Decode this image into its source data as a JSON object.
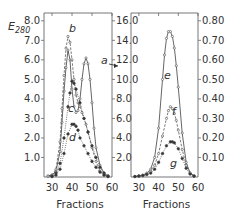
{
  "chart_data": [
    {
      "type": "line",
      "panel": "left",
      "ylabel": "E280",
      "xlabel": "Fractions",
      "xlim": [
        26,
        60
      ],
      "x_ticks": [
        30,
        40,
        50,
        60
      ],
      "ylim_left": [
        0,
        8.4
      ],
      "y_ticks_left": [
        "1.0",
        "2.0",
        "3.0",
        "4.0",
        "5.0",
        "6.0",
        "7.0",
        "8.0"
      ],
      "ylim_right": [
        0,
        16.8
      ],
      "y_ticks_right": [
        "2.0",
        "4.0",
        "6.0",
        "8.0",
        "10.0",
        "12.0",
        "14.0",
        "16.0"
      ],
      "series": [
        {
          "name": "a",
          "axis": "left",
          "style": "solid",
          "x": [
            28,
            30,
            32,
            34,
            35,
            36,
            37,
            38,
            39,
            40,
            41,
            42,
            43,
            44,
            45,
            46,
            47,
            48,
            49,
            50,
            51,
            52,
            54,
            56,
            58
          ],
          "y": [
            0.05,
            0.1,
            0.3,
            1.3,
            2.8,
            4.4,
            5.6,
            6.5,
            6.0,
            4.5,
            3.6,
            3.3,
            3.4,
            4.0,
            5.0,
            5.8,
            6.1,
            5.8,
            5.0,
            3.8,
            2.5,
            1.5,
            0.6,
            0.2,
            0.05
          ]
        },
        {
          "name": "b",
          "axis": "left",
          "style": "dashed",
          "x": [
            28,
            30,
            32,
            34,
            35,
            36,
            37,
            38,
            39,
            40,
            41,
            42,
            43,
            44,
            45,
            46,
            47,
            48,
            50,
            52,
            54,
            56,
            58
          ],
          "y": [
            0.05,
            0.1,
            0.4,
            1.8,
            3.5,
            5.2,
            6.6,
            7.2,
            6.9,
            6.0,
            5.0,
            4.2,
            3.8,
            3.6,
            3.3,
            3.0,
            2.7,
            2.3,
            1.5,
            0.8,
            0.3,
            0.1,
            0.05
          ]
        },
        {
          "name": "c",
          "axis": "left",
          "style": "dotted",
          "x": [
            30,
            32,
            34,
            36,
            38,
            39,
            40,
            41,
            42,
            44,
            46,
            48,
            50,
            52,
            54,
            56,
            58
          ],
          "y": [
            0.05,
            0.2,
            0.7,
            2.0,
            3.6,
            4.3,
            4.9,
            4.8,
            4.5,
            3.8,
            3.0,
            2.3,
            1.6,
            1.0,
            0.5,
            0.2,
            0.05
          ]
        },
        {
          "name": "d",
          "axis": "left",
          "style": "dotted",
          "x": [
            30,
            32,
            34,
            36,
            38,
            40,
            41,
            42,
            43,
            44,
            46,
            48,
            50,
            52,
            54,
            56,
            58
          ],
          "y": [
            0.02,
            0.1,
            0.4,
            1.2,
            2.2,
            2.7,
            2.7,
            2.6,
            2.4,
            2.0,
            1.6,
            1.2,
            0.8,
            0.5,
            0.25,
            0.1,
            0.02
          ]
        }
      ],
      "annotations": [
        "a",
        "b",
        "c",
        "d"
      ]
    },
    {
      "type": "line",
      "panel": "right",
      "xlabel": "Fractions",
      "xlim": [
        26,
        60
      ],
      "x_ticks": [
        30,
        40,
        50,
        60
      ],
      "ylim_right": [
        0,
        0.84
      ],
      "y_ticks_right": [
        "0.10",
        "0.20",
        "0.30",
        "0.40",
        "0.50",
        "0.60",
        "0.70",
        "0.80"
      ],
      "series": [
        {
          "name": "e",
          "axis": "left",
          "style": "solid",
          "x": [
            28,
            30,
            32,
            34,
            36,
            38,
            40,
            42,
            43,
            44,
            45,
            46,
            47,
            48,
            49,
            50,
            52,
            54,
            56,
            58
          ],
          "y": [
            0.05,
            0.1,
            0.2,
            0.4,
            0.8,
            2.0,
            5.0,
            10.0,
            12.5,
            14.2,
            14.9,
            14.9,
            14.4,
            13.2,
            11.4,
            9.2,
            4.5,
            1.5,
            0.4,
            0.1
          ]
        },
        {
          "name": "f",
          "axis": "left",
          "style": "dashed",
          "x": [
            28,
            30,
            32,
            34,
            36,
            38,
            40,
            42,
            44,
            45,
            46,
            47,
            48,
            49,
            50,
            52,
            54,
            56,
            58
          ],
          "y": [
            0.05,
            0.1,
            0.15,
            0.3,
            0.6,
            1.2,
            2.4,
            4.2,
            6.0,
            6.8,
            7.2,
            7.0,
            6.5,
            5.8,
            4.8,
            2.8,
            1.2,
            0.4,
            0.1
          ]
        },
        {
          "name": "g",
          "axis": "left",
          "style": "dotted",
          "x": [
            28,
            30,
            32,
            34,
            36,
            38,
            40,
            42,
            44,
            46,
            47,
            48,
            50,
            52,
            54,
            56,
            58
          ],
          "y": [
            0.05,
            0.1,
            0.15,
            0.25,
            0.4,
            0.8,
            1.5,
            2.4,
            3.2,
            3.6,
            3.6,
            3.5,
            2.9,
            1.9,
            0.9,
            0.3,
            0.1
          ]
        }
      ],
      "annotations": [
        "e",
        "f",
        "g"
      ]
    }
  ],
  "labels": {
    "ylabel_main": "E",
    "ylabel_sub": "280",
    "xlabel": "Fractions",
    "arrow_label": "a"
  }
}
